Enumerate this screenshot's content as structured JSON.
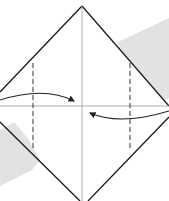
{
  "diagram": {
    "type": "origami-fold-step",
    "colors": {
      "background": "#ffffff",
      "shadow_band": "#e2e2e2",
      "outline": "#1a1a1a",
      "crease": "#9a9a9a",
      "fold_line": "#333333",
      "arrow": "#222222"
    },
    "elements": {
      "paper": "diamond",
      "creases": [
        "vertical-center",
        "horizontal-center"
      ],
      "fold_lines": [
        "left-vertical-dashed",
        "right-vertical-dashed"
      ],
      "arrows": [
        "left-to-center",
        "right-to-center"
      ]
    }
  }
}
